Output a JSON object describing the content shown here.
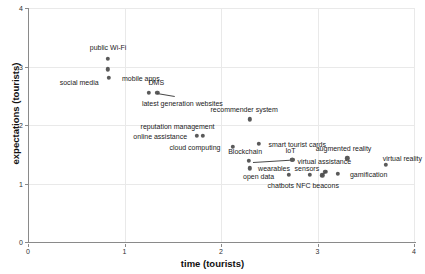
{
  "chart_data": {
    "type": "scatter",
    "title": "",
    "xlabel": "time (tourists)",
    "ylabel": "expectations (tourists)",
    "xlim": [
      0,
      4
    ],
    "ylim": [
      0,
      4
    ],
    "xticks": [
      "0",
      "1",
      "2",
      "3",
      "4"
    ],
    "yticks": [
      "0",
      "1",
      "2",
      "3",
      "4"
    ],
    "xtick_values": [
      0,
      1,
      2,
      3,
      4
    ],
    "ytick_values": [
      0,
      1,
      2,
      3,
      4
    ],
    "grid": true,
    "legend": "none",
    "marker_color": "#5a5a5a",
    "grid_color": "#e9e9e9",
    "axis_color": "#8a8a8a",
    "points": [
      {
        "label": "public Wi-Fi",
        "x": 0.83,
        "y": 3.13,
        "lx": 0.83,
        "ly": 3.33,
        "anchor": "center"
      },
      {
        "label": "social media",
        "x": 0.83,
        "y": 2.95,
        "lx": 0.53,
        "ly": 2.74,
        "anchor": "center"
      },
      {
        "label": "mobile apps",
        "x": 0.84,
        "y": 2.81,
        "lx": 1.17,
        "ly": 2.81,
        "anchor": "center"
      },
      {
        "label": "DMS",
        "x": 1.25,
        "y": 2.55,
        "lx": 1.33,
        "ly": 2.73,
        "anchor": "center"
      },
      {
        "label": "latest generation websites",
        "x": 1.34,
        "y": 2.55,
        "lx": 1.6,
        "ly": 2.37,
        "anchor": "center"
      },
      {
        "label": "recommender system",
        "x": 2.3,
        "y": 2.1,
        "lx": 2.24,
        "ly": 2.28,
        "anchor": "center"
      },
      {
        "label": "reputation management",
        "x": 1.75,
        "y": 1.82,
        "lx": 1.55,
        "ly": 1.99,
        "anchor": "center"
      },
      {
        "label": "online assistance",
        "x": 1.81,
        "y": 1.82,
        "lx": 1.37,
        "ly": 1.82,
        "anchor": "center"
      },
      {
        "label": "smart tourist cards",
        "x": 2.39,
        "y": 1.68,
        "lx": 2.79,
        "ly": 1.68,
        "anchor": "center"
      },
      {
        "label": "cloud computing",
        "x": 2.12,
        "y": 1.63,
        "lx": 1.73,
        "ly": 1.63,
        "anchor": "center"
      },
      {
        "label": "Blockchain",
        "x": 2.29,
        "y": 1.39,
        "lx": 2.25,
        "ly": 1.55,
        "anchor": "center"
      },
      {
        "label": "IoT",
        "x": 2.74,
        "y": 1.41,
        "lx": 2.72,
        "ly": 1.57,
        "anchor": "center"
      },
      {
        "label": "wearables",
        "x": 2.3,
        "y": 1.26,
        "lx": 2.55,
        "ly": 1.26,
        "anchor": "center"
      },
      {
        "label": "sensors",
        "x": 2.74,
        "y": 1.41,
        "lx": 2.89,
        "ly": 1.27,
        "anchor": "center"
      },
      {
        "label": "open data",
        "x": 2.7,
        "y": 1.15,
        "lx": 2.39,
        "ly": 1.12,
        "anchor": "center"
      },
      {
        "label": "chatbots",
        "x": 2.92,
        "y": 1.15,
        "lx": 2.62,
        "ly": 0.97,
        "anchor": "center"
      },
      {
        "label": "augmented reality",
        "x": 3.31,
        "y": 1.43,
        "lx": 3.27,
        "ly": 1.6,
        "anchor": "center"
      },
      {
        "label": "virtual reality",
        "x": 3.71,
        "y": 1.32,
        "lx": 3.88,
        "ly": 1.43,
        "anchor": "center"
      },
      {
        "label": "virtual assistance",
        "x": 3.08,
        "y": 1.2,
        "lx": 3.07,
        "ly": 1.38,
        "anchor": "center"
      },
      {
        "label": "NFC beacons",
        "x": 3.05,
        "y": 1.14,
        "lx": 3.0,
        "ly": 0.98,
        "anchor": "center"
      },
      {
        "label": "gamification",
        "x": 3.21,
        "y": 1.17,
        "lx": 3.53,
        "ly": 1.17,
        "anchor": "center"
      }
    ],
    "connectors": [
      {
        "name": "dms-to-websites",
        "x1": 1.34,
        "y1": 2.55,
        "x2": 1.52,
        "y2": 2.5
      },
      {
        "name": "blockchain-to-iot",
        "x1": 2.33,
        "y1": 1.37,
        "x2": 2.71,
        "y2": 1.41
      },
      {
        "name": "nfc-to-virtual-assist",
        "x1": 3.04,
        "y1": 1.13,
        "x2": 3.1,
        "y2": 1.23
      }
    ]
  }
}
